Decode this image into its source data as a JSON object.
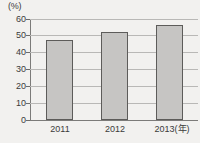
{
  "chart_data": {
    "type": "bar",
    "title": "",
    "subtitle": "",
    "xlabel": "年",
    "ylabel": "(%)",
    "unit_label": "(%)",
    "categories": [
      "2011",
      "2012",
      "2013(年)"
    ],
    "category_values": [
      "2011",
      "2012",
      "2013"
    ],
    "values": [
      47.5,
      52.5,
      56.5
    ],
    "series": [
      {
        "name": "",
        "values": [
          47.5,
          52.5,
          56.5
        ]
      }
    ],
    "ylim": [
      0,
      60
    ],
    "ytick_labels": [
      "0",
      "10",
      "20",
      "30",
      "40",
      "50",
      "60"
    ],
    "ytick_values": [
      0,
      10,
      20,
      30,
      40,
      50,
      60
    ],
    "grid": true,
    "legend": false,
    "legend_position": "none",
    "bar_color": "#c6c5c3",
    "bar_border_color": "#5d5c5a",
    "gridline_color": "#b9b8b6",
    "axis_color": "#7c7b79",
    "background_color": "#f2f1ef",
    "text_color": "#3b3b3b"
  }
}
